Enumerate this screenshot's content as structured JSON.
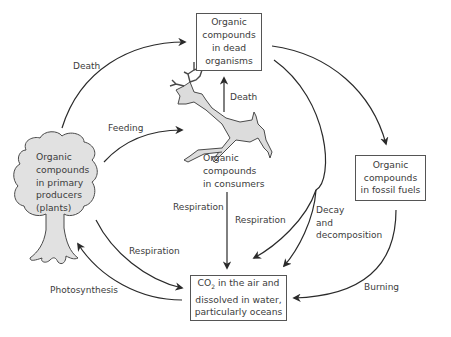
{
  "diagram": {
    "nodes": {
      "dead": {
        "line1": "Organic",
        "line2": "compounds",
        "line3": "in dead",
        "line4": "organisms"
      },
      "consumers": {
        "line1": "Organic",
        "line2": "compounds",
        "line3": "in consumers"
      },
      "producers": {
        "line1": "Organic",
        "line2": "compounds",
        "line3": "in primary",
        "line4": "producers",
        "line5": "(plants)"
      },
      "fossil": {
        "line1": "Organic",
        "line2": "compounds",
        "line3": "in fossil fuels"
      },
      "co2": {
        "line1_pre": "CO",
        "line1_sub": "2",
        "line1_post": " in the air and",
        "line2": "dissolved in water,",
        "line3": "particularly oceans"
      }
    },
    "edges": [
      {
        "from": "producers",
        "to": "dead",
        "label": "Death"
      },
      {
        "from": "producers",
        "to": "consumers",
        "label": "Feeding"
      },
      {
        "from": "consumers",
        "to": "dead",
        "label": "Death"
      },
      {
        "from": "dead",
        "to": "fossil",
        "label": ""
      },
      {
        "from": "consumers",
        "to": "co2",
        "label": "Respiration"
      },
      {
        "from": "dead",
        "to": "co2",
        "label": "Respiration"
      },
      {
        "from": "dead",
        "to": "co2",
        "label": "Decay and decomposition"
      },
      {
        "from": "producers",
        "to": "co2",
        "label": "Respiration"
      },
      {
        "from": "co2",
        "to": "producers",
        "label": "Photosynthesis"
      },
      {
        "from": "fossil",
        "to": "co2",
        "label": "Burning"
      }
    ],
    "labels": {
      "death_top": "Death",
      "death_consumer": "Death",
      "feeding": "Feeding",
      "resp_consumer": "Respiration",
      "resp_dead": "Respiration",
      "decay1": "Decay",
      "decay2": "and",
      "decay3": "decomposition",
      "resp_plants": "Respiration",
      "photosynthesis": "Photosynthesis",
      "burning": "Burning"
    }
  }
}
